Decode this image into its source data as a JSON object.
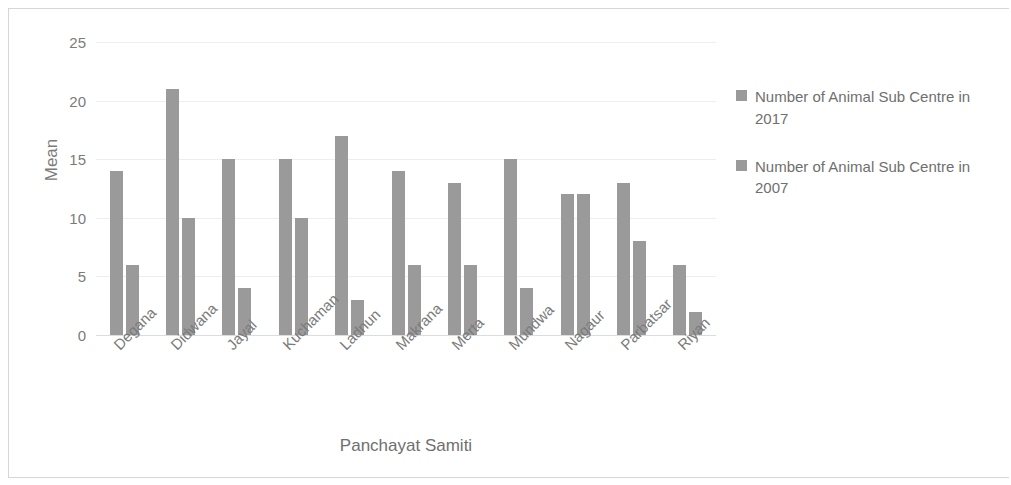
{
  "chart_data": {
    "type": "bar",
    "title": "",
    "xlabel": "Panchayat Samiti",
    "ylabel": "Mean",
    "ylim": [
      0,
      25
    ],
    "yticks": [
      0,
      5,
      10,
      15,
      20,
      25
    ],
    "grid": true,
    "legend_position": "right",
    "categories": [
      "Degana",
      "Didwana",
      "Jayal",
      "Kuchaman",
      "Ladnun",
      "Makrana",
      "Merta",
      "Mundwa",
      "Nagaur",
      "Parbatsar",
      "Riyan"
    ],
    "series": [
      {
        "name": "Number of Animal Sub Centre in 2017",
        "color": "#9a9a9a",
        "values": [
          14,
          21,
          15,
          15,
          17,
          14,
          13,
          15,
          12,
          13,
          6
        ]
      },
      {
        "name": "Number of Animal Sub Centre in 2007",
        "color": "#9a9a9a",
        "values": [
          6,
          10,
          4,
          10,
          3,
          6,
          6,
          4,
          12,
          8,
          2
        ]
      }
    ]
  },
  "legend": {
    "entries": [
      {
        "label": "Number of Animal Sub Centre in 2017",
        "swatch_name": "legend-swatch-2017"
      },
      {
        "label": "Number of Animal Sub Centre in 2007",
        "swatch_name": "legend-swatch-2007"
      }
    ]
  },
  "axes": {
    "y_title": "Mean",
    "x_title": "Panchayat Samiti",
    "y_tick_labels": [
      "0",
      "5",
      "10",
      "15",
      "20",
      "25"
    ]
  },
  "colors": {
    "bar": "#9a9a9a",
    "text": "#7b7b7b",
    "grid": "#eeeeee",
    "frame": "#d6d6d6",
    "background": "#ffffff"
  }
}
